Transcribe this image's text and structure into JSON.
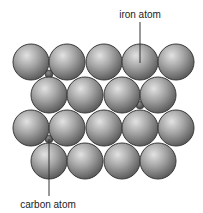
{
  "diagram": {
    "labels": {
      "iron": "iron atom",
      "carbon": "carbon atom"
    },
    "iron_atoms": {
      "radius": 18,
      "rows": [
        {
          "y": 62,
          "x": [
            31,
            67,
            104,
            140,
            176
          ]
        },
        {
          "y": 95,
          "x": [
            49,
            85,
            122,
            158
          ]
        },
        {
          "y": 128,
          "x": [
            31,
            67,
            104,
            140,
            176
          ]
        },
        {
          "y": 161,
          "x": [
            49,
            85,
            122,
            158
          ]
        }
      ]
    },
    "carbon_atoms": {
      "radius": 4,
      "positions": [
        {
          "x": 49,
          "y": 74
        },
        {
          "x": 140,
          "y": 105
        },
        {
          "x": 49,
          "y": 139
        }
      ]
    },
    "callouts": {
      "iron": {
        "label_x": 140,
        "label_y": 9,
        "line_x": 140,
        "line_y1": 22,
        "line_y2": 63
      },
      "carbon": {
        "label_x": 48,
        "label_y": 199,
        "line_x": 49,
        "line_y1": 139,
        "line_y2": 196
      }
    },
    "colors": {
      "atom_light": "#d8d8d8",
      "atom_mid": "#9a9a9a",
      "atom_dark": "#5a5a5a",
      "atom_outline": "#3a3a3a",
      "carbon": "#505050",
      "line": "#333333"
    }
  }
}
